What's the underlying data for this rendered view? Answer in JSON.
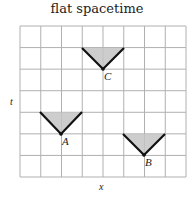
{
  "title": "flat spacetime",
  "axes": {
    "x_label": "x",
    "t_label": "t"
  },
  "grid": {
    "columns": 8,
    "rows": 7,
    "x0": 20,
    "y0": 26,
    "x1": 186,
    "y1": 177,
    "line_color": "#b0b0b0"
  },
  "events": [
    {
      "label": "C",
      "apex": [
        103,
        69
      ],
      "half_width": 21,
      "height": 21
    },
    {
      "label": "A",
      "apex": [
        61,
        134
      ],
      "half_width": 21,
      "height": 22
    },
    {
      "label": "B",
      "apex": [
        144,
        155
      ],
      "half_width": 21,
      "height": 21
    }
  ],
  "colors": {
    "cone_fill": "#c4c4c4",
    "cone_edge": "#111111"
  }
}
